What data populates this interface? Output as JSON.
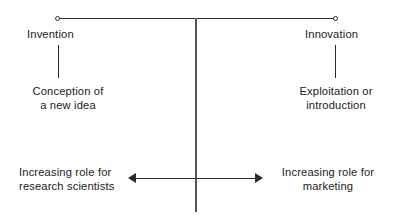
{
  "diagram": {
    "colors": {
      "line": "#2a2a2a",
      "center_axis": "#555555",
      "text": "#1a1a1a",
      "background": "#ffffff"
    },
    "axis": {
      "left_endpoint_icon": "open-circle-icon",
      "right_endpoint_icon": "open-circle-icon"
    },
    "poles": {
      "left": {
        "heading": "Invention",
        "description": "Conception of\na new idea"
      },
      "right": {
        "heading": "Innovation",
        "description": "Exploitation or\nintroduction"
      }
    },
    "roles": {
      "left": {
        "label": "Increasing role for\nresearch scientists",
        "arrow_direction": "left"
      },
      "right": {
        "label": "Increasing role for\nmarketing",
        "arrow_direction": "right"
      }
    }
  }
}
